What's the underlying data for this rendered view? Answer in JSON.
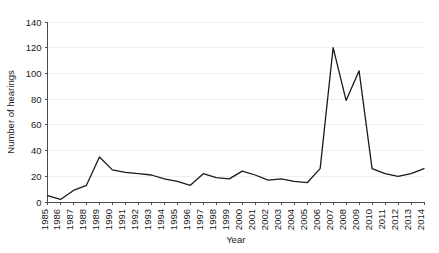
{
  "chart_data": {
    "type": "line",
    "title": "",
    "subtitle": "",
    "xlabel": "Year",
    "ylabel": "Number of hearings",
    "xlim": [
      1985,
      2014
    ],
    "ylim": [
      0,
      140
    ],
    "ytick_step": 20,
    "grid": "horizontal",
    "legend": "none",
    "line_color": "#1a1a1a",
    "grid_color": "#efefef",
    "axis_color": "#4d4d4d",
    "background": "#ffffff",
    "categories": [
      "1985",
      "1986",
      "1987",
      "1988",
      "1989",
      "1990",
      "1991",
      "1992",
      "1993",
      "1994",
      "1995",
      "1996",
      "1997",
      "1998",
      "1999",
      "2000",
      "2001",
      "2002",
      "2003",
      "2004",
      "2005",
      "2006",
      "2007",
      "2008",
      "2009",
      "2010",
      "2011",
      "2012",
      "2013",
      "2014"
    ],
    "yticks": [
      "0",
      "20",
      "40",
      "60",
      "80",
      "100",
      "120",
      "140"
    ],
    "values": [
      5,
      2,
      9,
      13,
      35,
      25,
      23,
      22,
      21,
      18,
      16,
      13,
      22,
      19,
      18,
      24,
      21,
      17,
      18,
      16,
      15,
      26,
      120,
      79,
      102,
      26,
      22,
      20,
      22,
      26
    ],
    "series": [
      {
        "name": "Number of hearings",
        "values": [
          5,
          2,
          9,
          13,
          35,
          25,
          23,
          22,
          21,
          18,
          16,
          13,
          22,
          19,
          18,
          24,
          21,
          17,
          18,
          16,
          15,
          26,
          120,
          79,
          102,
          26,
          22,
          20,
          22,
          26
        ]
      }
    ],
    "annotations": []
  }
}
